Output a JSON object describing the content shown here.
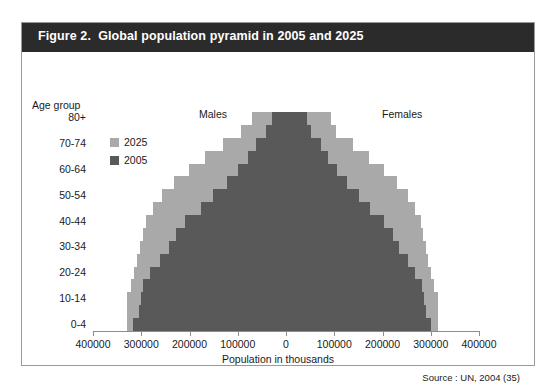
{
  "figure": {
    "title": "Figure 2.  Global population pyramid in 2005 and 2025",
    "source": "Source : UN, 2004 (35)",
    "header_color": "#2b2b2b",
    "frame_color": "#9a9a9a"
  },
  "labels": {
    "age_group_title": "Age group",
    "males": "Males",
    "females": "Females",
    "x_axis_title": "Population in thousands"
  },
  "legend": {
    "position": "upper-left",
    "items": [
      {
        "label": "2025",
        "color": "#a9a9a9"
      },
      {
        "label": "2005",
        "color": "#595959"
      }
    ]
  },
  "chart_data": {
    "type": "bar",
    "orientation": "horizontal-diverging",
    "title": "Global population pyramid in 2005 and 2025",
    "xlabel": "Population in thousands",
    "ylabel": "Age group",
    "xlim": [
      -400000,
      400000
    ],
    "xticks": [
      -400000,
      -300000,
      -200000,
      -100000,
      0,
      100000,
      200000,
      300000,
      400000
    ],
    "xtick_labels": [
      "400000",
      "300000",
      "200000",
      "100000",
      "0",
      "100000",
      "200000",
      "300000",
      "400000"
    ],
    "grid": false,
    "legend_position": "upper-left",
    "categories": [
      "0-4",
      "5-9",
      "10-14",
      "15-19",
      "20-24",
      "25-29",
      "30-34",
      "35-39",
      "40-44",
      "45-49",
      "50-54",
      "55-59",
      "60-64",
      "65-69",
      "70-74",
      "75-79",
      "80+"
    ],
    "ytick_labels": [
      "0-4",
      "10-14",
      "20-24",
      "30-34",
      "40-44",
      "50-54",
      "60-64",
      "70-74",
      "80+"
    ],
    "series": [
      {
        "name": "2005",
        "color": "#595959",
        "males": [
          -317000,
          -305000,
          -300000,
          -296000,
          -281000,
          -262000,
          -242000,
          -227000,
          -209000,
          -177000,
          -151000,
          -123000,
          -100000,
          -79000,
          -63000,
          -42000,
          -30000
        ],
        "females": [
          301000,
          290000,
          285000,
          281000,
          268000,
          252000,
          235000,
          221000,
          204000,
          175000,
          151000,
          126000,
          105000,
          87000,
          73000,
          52000,
          44000
        ]
      },
      {
        "name": "2025",
        "color": "#a9a9a9",
        "males": [
          -330000,
          -330000,
          -330000,
          -322000,
          -314000,
          -309000,
          -303000,
          -296000,
          -290000,
          -276000,
          -257000,
          -232000,
          -202000,
          -167000,
          -130000,
          -93000,
          -71000
        ],
        "females": [
          314000,
          314000,
          314000,
          307000,
          300000,
          295000,
          290000,
          284000,
          279000,
          268000,
          252000,
          230000,
          203000,
          172000,
          139000,
          104000,
          93000
        ]
      }
    ]
  }
}
